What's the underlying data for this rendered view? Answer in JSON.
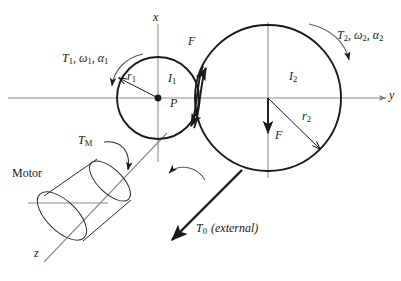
{
  "figure": {
    "colors": {
      "ink": "#1a1a1a",
      "axis": "#808080",
      "background": "#ffffff"
    },
    "axes": {
      "x_label": "x",
      "y_label": "y",
      "z_label": "z"
    },
    "gear1": {
      "inertia_label": "I",
      "inertia_sub": "1",
      "radius_label": "r",
      "radius_sub": "1",
      "center_point_label": "P",
      "drive_label_prefix": "T",
      "drive_label_sub1": "1",
      "drive_label_omega": "ω",
      "drive_label_sub2": "1",
      "drive_label_alpha": "α",
      "drive_label_sub3": "1",
      "drive_label_full": "T1, ω1, α1",
      "center_x": 158,
      "center_y": 98,
      "radius_px": 41
    },
    "gear2": {
      "inertia_label": "I",
      "inertia_sub": "2",
      "radius_label": "r",
      "radius_sub": "2",
      "drive_label_prefix": "T",
      "drive_label_sub1": "2",
      "drive_label_omega": "ω",
      "drive_label_sub2": "2",
      "drive_label_alpha": "α",
      "drive_label_sub3": "2",
      "drive_label_full": "T2, ω2, α2",
      "center_x": 268,
      "center_y": 98,
      "radius_px": 73
    },
    "forces": {
      "contact_force_upper_label": "F",
      "contact_force_lower_label": "F"
    },
    "motor": {
      "label": "Motor",
      "torque_label": "T",
      "torque_sub": "M"
    },
    "external": {
      "torque_label": "T",
      "torque_sub": "0",
      "torque_note": "(external)"
    }
  }
}
